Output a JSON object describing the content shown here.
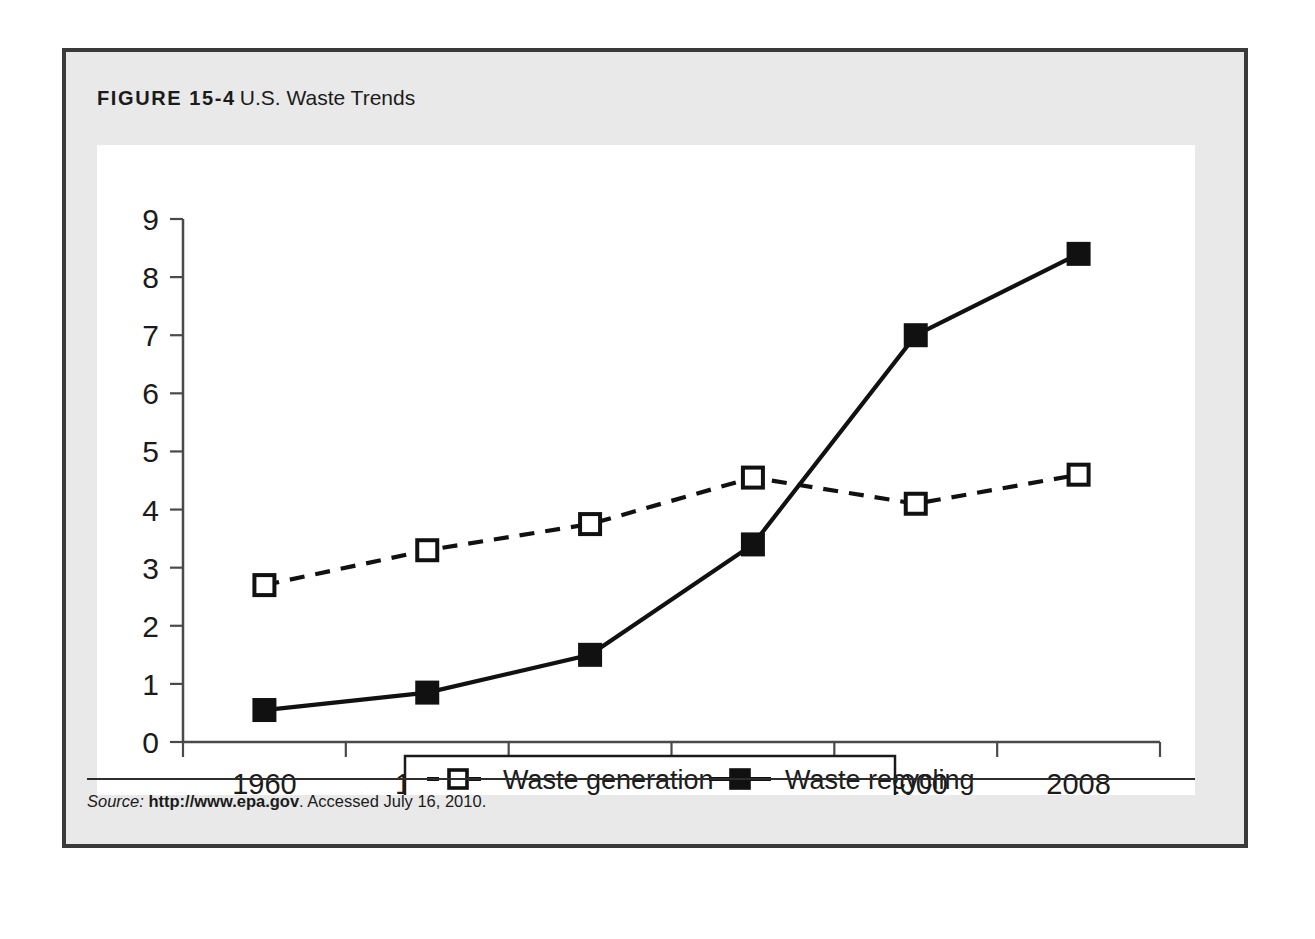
{
  "figure": {
    "label": "FIGURE 15-4",
    "title": "U.S. Waste Trends"
  },
  "source": {
    "label": "Source:",
    "url": "http://www.epa.gov",
    "rest": ". Accessed July 16, 2010."
  },
  "colors": {
    "panel_background": "#e9e9e9",
    "panel_border": "#3a3a3a",
    "plot_background": "#ffffff",
    "ink": "#1b1b1b",
    "axis": "#4a4a4a"
  },
  "chart_data": {
    "type": "line",
    "title": "U.S. Waste Trends",
    "xlabel": "",
    "ylabel": "",
    "categories": [
      "1960",
      "1970",
      "1980",
      "1990",
      "2000",
      "2008"
    ],
    "x": [
      1960,
      1970,
      1980,
      1990,
      2000,
      2008
    ],
    "ylim": [
      0,
      9
    ],
    "yticks": [
      "0",
      "1",
      "2",
      "3",
      "4",
      "5",
      "6",
      "7",
      "8",
      "9"
    ],
    "grid": false,
    "legend_position": "bottom",
    "series": [
      {
        "name": "Waste generation",
        "values": [
          2.7,
          3.3,
          3.75,
          4.55,
          4.1,
          4.6
        ],
        "style": "dashed",
        "marker": "open-square",
        "color": "#111111"
      },
      {
        "name": "Waste recycling",
        "values": [
          0.55,
          0.85,
          1.5,
          3.4,
          7.0,
          8.4
        ],
        "style": "solid",
        "marker": "filled-square",
        "color": "#111111"
      }
    ]
  }
}
